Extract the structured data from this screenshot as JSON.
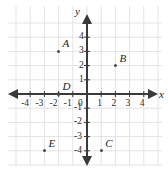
{
  "chart_data": {
    "type": "scatter",
    "title": "",
    "xlabel": "x",
    "ylabel": "y",
    "xlim": [
      -4.7,
      4.7
    ],
    "ylim": [
      -4.7,
      4.7
    ],
    "grid": true,
    "legend": false,
    "x_ticks": [
      "-4",
      "-3",
      "-2",
      "-1",
      "1",
      "2",
      "3",
      "4"
    ],
    "y_ticks": [
      "4",
      "3",
      "2",
      "1",
      "-1",
      "-2",
      "-3",
      "-4"
    ],
    "origin_label": "0",
    "points": [
      {
        "label": "A",
        "x": -2,
        "y": 3
      },
      {
        "label": "B",
        "x": 2,
        "y": 2
      },
      {
        "label": "C",
        "x": 1,
        "y": -4
      },
      {
        "label": "D",
        "x": -2,
        "y": 0
      },
      {
        "label": "E",
        "x": -3,
        "y": -4
      }
    ],
    "colors": {
      "background": "#ffffff",
      "grid": "#e3e3e3",
      "axis": "#3a3a3a",
      "point": "#4a4a4a",
      "text": "#1d1d1d"
    }
  }
}
